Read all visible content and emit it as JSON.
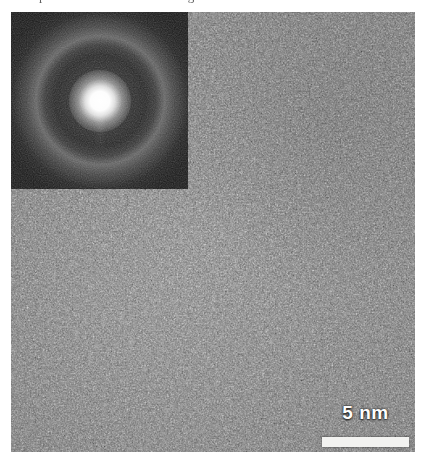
{
  "figure": {
    "kind": "hrtem-micrograph",
    "clipped_caption": "amorphous thin film region",
    "background_color": "#ffffff"
  },
  "micrograph": {
    "name": "high-resolution-tem-image",
    "description": "Amorphous speckle contrast high-resolution TEM micrograph",
    "mean_gray": "#6e6e6e"
  },
  "inset": {
    "name": "selected-area-diffraction-inset",
    "description": "Diffuse halo ring diffraction pattern of an amorphous phase",
    "background_color": "#121212",
    "center_spot_color": "#ffffff",
    "halo_ring_color": "#b4b4b4"
  },
  "scalebar": {
    "value": "5",
    "unit": "nm",
    "label": "5 nm",
    "bar_color": "#f2f2f0",
    "text_color": "#fdfdfd",
    "length_px": 87
  }
}
